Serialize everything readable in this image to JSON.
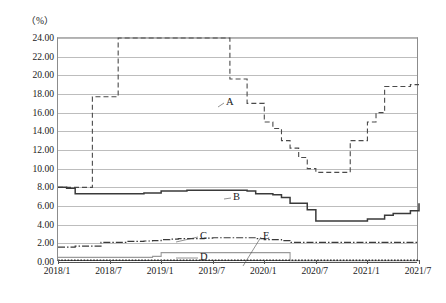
{
  "chart_data": {
    "type": "line",
    "title": "",
    "unit_label": "（%）",
    "xlabel": "",
    "ylabel": "",
    "grid": true,
    "legend_position": "inline-annotations",
    "ylim": [
      0.0,
      24.0
    ],
    "yticks": [
      "0.00",
      "2.00",
      "4.00",
      "6.00",
      "8.00",
      "10.00",
      "12.00",
      "14.00",
      "16.00",
      "18.00",
      "20.00",
      "22.00",
      "24.00"
    ],
    "ytick_values": [
      0,
      2,
      4,
      6,
      8,
      10,
      12,
      14,
      16,
      18,
      20,
      22,
      24
    ],
    "xticks": [
      "2018/1",
      "2018/7",
      "2019/1",
      "2019/7",
      "2020/1",
      "2020/7",
      "2021/1",
      "2021/7"
    ],
    "xtick_index": [
      0,
      6,
      12,
      18,
      24,
      30,
      36,
      42
    ],
    "x": [
      "2018/1",
      "2018/2",
      "2018/3",
      "2018/4",
      "2018/5",
      "2018/6",
      "2018/7",
      "2018/8",
      "2018/9",
      "2018/10",
      "2018/11",
      "2018/12",
      "2019/1",
      "2019/2",
      "2019/3",
      "2019/4",
      "2019/5",
      "2019/6",
      "2019/7",
      "2019/8",
      "2019/9",
      "2019/10",
      "2019/11",
      "2019/12",
      "2020/1",
      "2020/2",
      "2020/3",
      "2020/4",
      "2020/5",
      "2020/6",
      "2020/7",
      "2020/8",
      "2020/9",
      "2020/10",
      "2020/11",
      "2020/12",
      "2021/1",
      "2021/2",
      "2021/3",
      "2021/4",
      "2021/5",
      "2021/6",
      "2021/7"
    ],
    "series": [
      {
        "name": "A",
        "style": "dashed",
        "color": "#4a4a4a",
        "label_x_index": 19,
        "label_y": 17.2,
        "values": [
          8.0,
          8.0,
          8.0,
          8.0,
          17.7,
          17.7,
          17.7,
          24.0,
          24.0,
          24.0,
          24.0,
          24.0,
          24.0,
          24.0,
          24.0,
          24.0,
          24.0,
          24.0,
          24.0,
          24.0,
          19.6,
          19.6,
          17.0,
          17.0,
          15.0,
          14.3,
          13.0,
          12.2,
          11.2,
          10.0,
          9.6,
          9.6,
          9.6,
          9.6,
          13.0,
          13.0,
          15.0,
          16.0,
          18.8,
          18.8,
          18.8,
          19.0,
          19.0
        ]
      },
      {
        "name": "B",
        "style": "solid",
        "color": "#3a3a3a",
        "label_x_index": 21,
        "label_y": 7.0,
        "values": [
          8.0,
          7.9,
          7.3,
          7.3,
          7.3,
          7.3,
          7.3,
          7.3,
          7.3,
          7.3,
          7.4,
          7.4,
          7.6,
          7.6,
          7.6,
          7.7,
          7.7,
          7.7,
          7.7,
          7.7,
          7.7,
          7.7,
          7.6,
          7.3,
          7.3,
          7.2,
          6.9,
          6.3,
          6.3,
          5.6,
          4.4,
          4.4,
          4.4,
          4.4,
          4.4,
          4.4,
          4.6,
          4.6,
          5.0,
          5.2,
          5.2,
          5.5,
          6.3
        ]
      },
      {
        "name": "C",
        "style": "dashdot",
        "color": "#3a3a3a",
        "label_x_index": 18,
        "label_y": 3.1,
        "values": [
          1.6,
          1.6,
          1.7,
          1.7,
          1.7,
          2.1,
          2.1,
          2.1,
          2.2,
          2.2,
          2.25,
          2.3,
          2.4,
          2.45,
          2.5,
          2.5,
          2.5,
          2.55,
          2.6,
          2.6,
          2.6,
          2.6,
          2.6,
          2.5,
          2.4,
          2.4,
          2.3,
          2.1,
          2.1,
          2.1,
          2.1,
          2.1,
          2.1,
          2.1,
          2.1,
          2.1,
          2.1,
          2.1,
          2.1,
          2.1,
          2.1,
          2.1,
          2.1
        ]
      },
      {
        "name": "D",
        "style": "thin",
        "color": "#9a9a9a",
        "label_x_index": 18,
        "label_y": 1.35,
        "values": [
          0.5,
          0.5,
          0.5,
          0.5,
          0.5,
          0.5,
          0.5,
          0.5,
          0.5,
          0.5,
          0.5,
          0.6,
          1.0,
          1.0,
          1.0,
          1.0,
          1.0,
          1.0,
          1.0,
          1.0,
          1.0,
          1.0,
          1.0,
          1.0,
          1.0,
          1.0,
          1.0,
          0.15,
          0.15,
          0.15,
          0.15,
          0.15,
          0.15,
          0.15,
          0.15,
          0.15,
          0.15,
          0.15,
          0.15,
          0.15,
          0.15,
          0.15,
          0.15
        ]
      },
      {
        "name": "E",
        "style": "dotted",
        "color": "#2a2a2a",
        "label_x_index": 24,
        "label_y": 2.9,
        "values": [
          0.18,
          0.18,
          0.18,
          0.18,
          0.18,
          0.18,
          0.18,
          0.18,
          0.18,
          0.18,
          0.18,
          0.18,
          0.18,
          0.18,
          0.18,
          0.18,
          0.18,
          0.18,
          0.18,
          0.18,
          0.18,
          0.18,
          0.18,
          0.18,
          0.18,
          0.18,
          0.18,
          0.18,
          0.18,
          0.18,
          0.18,
          0.18,
          0.18,
          0.18,
          0.18,
          0.18,
          0.18,
          0.18,
          0.18,
          0.18,
          0.18,
          0.18,
          0.18
        ]
      }
    ]
  }
}
